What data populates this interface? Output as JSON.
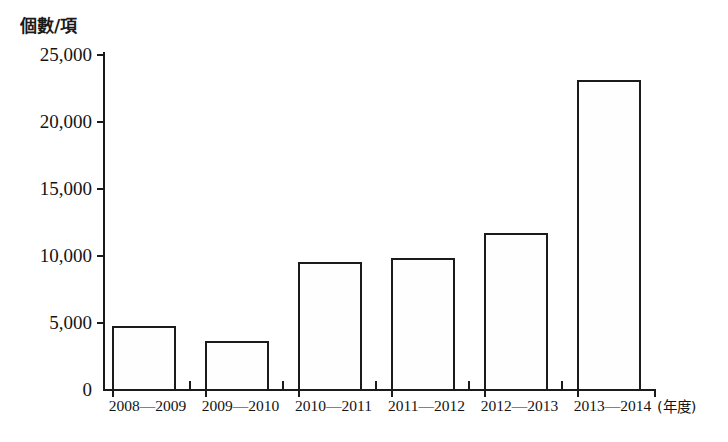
{
  "chart_data": {
    "type": "bar",
    "title": "",
    "subtitle": "",
    "ylabel": "個數/項",
    "xlabel": "(年度)",
    "categories": [
      "2008—2009",
      "2009—2010",
      "2010—2011",
      "2011—2012",
      "2012—2013",
      "2013—2014"
    ],
    "values": [
      4800,
      3700,
      9600,
      9900,
      11750,
      23150
    ],
    "ylim": [
      0,
      25000
    ],
    "ytick_values": [
      0,
      5000,
      10000,
      15000,
      20000,
      25000
    ],
    "ytick_labels": [
      "0",
      "5,000",
      "10,000",
      "15,000",
      "20,000",
      "25,000"
    ],
    "grid": false,
    "legend": null,
    "series": [
      {
        "name": "個數/項",
        "values": [
          4800,
          3700,
          9600,
          9900,
          11750,
          23150
        ]
      }
    ],
    "bar_style": {
      "fill": "#fefefe",
      "outline": "#1b1b1b"
    }
  },
  "axes": {
    "y_title": "個數/項",
    "x_unit": "(年度)"
  }
}
